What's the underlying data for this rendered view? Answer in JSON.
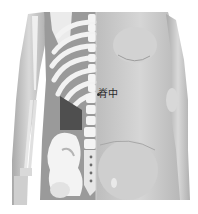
{
  "figure": {
    "left_half": "skeleton with ribs, spine, pelvis and arm bones",
    "right_half": "skin surface with back musculature and arm"
  },
  "acupoint": {
    "label": "脊中",
    "marker": "dot"
  },
  "colors": {
    "background": "#ffffff",
    "skin": "#c9c9c9",
    "skin_shadow": "#a8a8a8",
    "bone": "#eeeeee",
    "bone_shadow": "#8c8c8c",
    "cavity": "#555555",
    "label": "#2a2a2a"
  }
}
